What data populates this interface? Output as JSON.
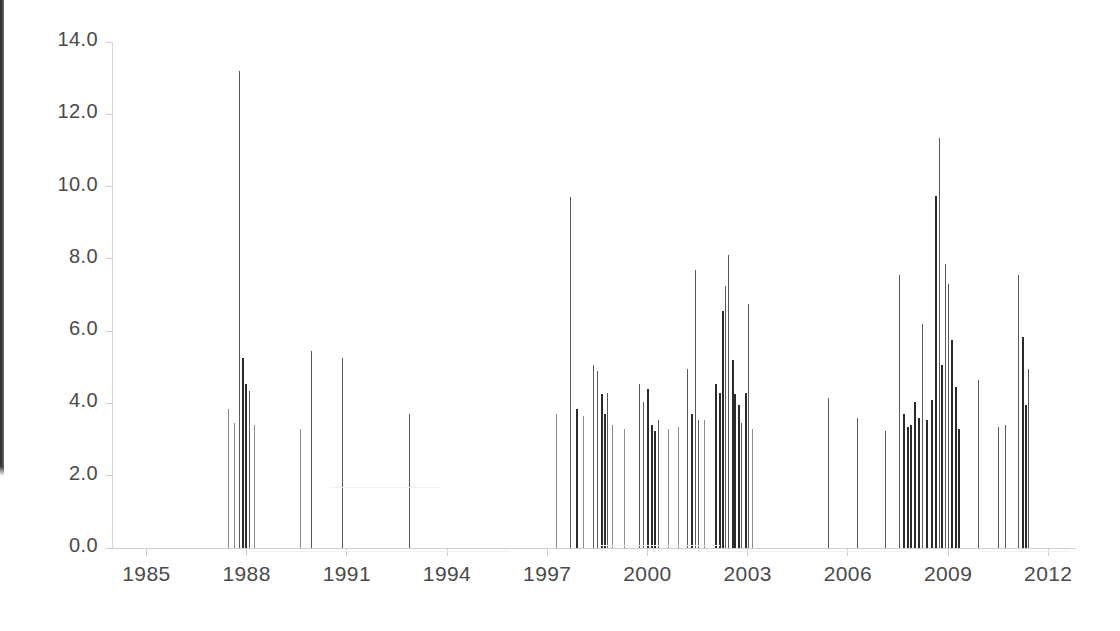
{
  "chart_data": {
    "type": "bar",
    "title": "",
    "subtitle": "",
    "xlabel": "",
    "ylabel": "",
    "xlim": [
      1984.0,
      2012.8
    ],
    "ylim": [
      0.0,
      14.0
    ],
    "grid": false,
    "legend": null,
    "y_ticks": [
      "0.0",
      "2.0",
      "4.0",
      "6.0",
      "8.0",
      "10.0",
      "12.0",
      "14.0"
    ],
    "y_tick_values": [
      0.0,
      2.0,
      4.0,
      6.0,
      8.0,
      10.0,
      12.0,
      14.0
    ],
    "x_ticks": [
      "1985",
      "1988",
      "1991",
      "1994",
      "1997",
      "2000",
      "2003",
      "2006",
      "2009",
      "2012"
    ],
    "x_tick_values": [
      1985,
      1988,
      1991,
      1994,
      1997,
      2000,
      2003,
      2006,
      2009,
      2012
    ],
    "series_name": "magnitude",
    "points": [
      {
        "x": 1987.45,
        "y": 3.85,
        "w": "light"
      },
      {
        "x": 1987.62,
        "y": 3.45,
        "w": "light"
      },
      {
        "x": 1987.78,
        "y": 13.2,
        "w": "normal"
      },
      {
        "x": 1987.86,
        "y": 5.25,
        "w": "heavy"
      },
      {
        "x": 1987.96,
        "y": 4.55,
        "w": "heavy"
      },
      {
        "x": 1988.06,
        "y": 4.35,
        "w": "normal"
      },
      {
        "x": 1988.22,
        "y": 3.4,
        "w": "light"
      },
      {
        "x": 1989.6,
        "y": 3.3,
        "w": "light"
      },
      {
        "x": 1989.92,
        "y": 5.45,
        "w": "normal"
      },
      {
        "x": 1990.86,
        "y": 5.25,
        "w": "normal"
      },
      {
        "x": 1992.85,
        "y": 3.7,
        "w": "normal"
      },
      {
        "x": 1997.25,
        "y": 3.7,
        "w": "light"
      },
      {
        "x": 1997.68,
        "y": 9.7,
        "w": "normal"
      },
      {
        "x": 1997.86,
        "y": 3.85,
        "w": "heavy"
      },
      {
        "x": 1998.06,
        "y": 3.65,
        "w": "light"
      },
      {
        "x": 1998.38,
        "y": 5.05,
        "w": "normal"
      },
      {
        "x": 1998.5,
        "y": 4.9,
        "w": "normal"
      },
      {
        "x": 1998.62,
        "y": 4.25,
        "w": "heavy"
      },
      {
        "x": 1998.7,
        "y": 3.7,
        "w": "heavy"
      },
      {
        "x": 1998.78,
        "y": 4.3,
        "w": "normal"
      },
      {
        "x": 1998.94,
        "y": 3.4,
        "w": "light"
      },
      {
        "x": 1999.3,
        "y": 3.3,
        "w": "light"
      },
      {
        "x": 1999.75,
        "y": 4.55,
        "w": "normal"
      },
      {
        "x": 1999.88,
        "y": 4.05,
        "w": "normal"
      },
      {
        "x": 2000.0,
        "y": 4.4,
        "w": "heavy"
      },
      {
        "x": 2000.1,
        "y": 3.4,
        "w": "heavy"
      },
      {
        "x": 2000.2,
        "y": 3.25,
        "w": "heavy"
      },
      {
        "x": 2000.32,
        "y": 3.55,
        "w": "normal"
      },
      {
        "x": 2000.62,
        "y": 3.3,
        "w": "light"
      },
      {
        "x": 2000.92,
        "y": 3.35,
        "w": "light"
      },
      {
        "x": 2001.18,
        "y": 4.95,
        "w": "normal"
      },
      {
        "x": 2001.3,
        "y": 3.7,
        "w": "heavy"
      },
      {
        "x": 2001.42,
        "y": 7.7,
        "w": "normal"
      },
      {
        "x": 2001.52,
        "y": 3.55,
        "w": "normal"
      },
      {
        "x": 2001.7,
        "y": 3.55,
        "w": "light"
      },
      {
        "x": 2002.02,
        "y": 4.55,
        "w": "heavy"
      },
      {
        "x": 2002.14,
        "y": 4.3,
        "w": "heavy"
      },
      {
        "x": 2002.24,
        "y": 6.55,
        "w": "heavy"
      },
      {
        "x": 2002.32,
        "y": 7.25,
        "w": "normal"
      },
      {
        "x": 2002.42,
        "y": 8.1,
        "w": "normal"
      },
      {
        "x": 2002.52,
        "y": 5.2,
        "w": "heavy"
      },
      {
        "x": 2002.6,
        "y": 4.25,
        "w": "heavy"
      },
      {
        "x": 2002.7,
        "y": 3.95,
        "w": "heavy"
      },
      {
        "x": 2002.8,
        "y": 3.45,
        "w": "normal"
      },
      {
        "x": 2002.92,
        "y": 4.3,
        "w": "heavy"
      },
      {
        "x": 2003.02,
        "y": 6.75,
        "w": "normal"
      },
      {
        "x": 2003.14,
        "y": 3.3,
        "w": "light"
      },
      {
        "x": 2005.4,
        "y": 4.15,
        "w": "normal"
      },
      {
        "x": 2006.28,
        "y": 3.6,
        "w": "normal"
      },
      {
        "x": 2007.12,
        "y": 3.25,
        "w": "normal"
      },
      {
        "x": 2007.52,
        "y": 7.55,
        "w": "normal"
      },
      {
        "x": 2007.64,
        "y": 3.7,
        "w": "heavy"
      },
      {
        "x": 2007.76,
        "y": 3.35,
        "w": "heavy"
      },
      {
        "x": 2007.86,
        "y": 3.4,
        "w": "heavy"
      },
      {
        "x": 2007.98,
        "y": 4.05,
        "w": "heavy"
      },
      {
        "x": 2008.1,
        "y": 3.6,
        "w": "heavy"
      },
      {
        "x": 2008.22,
        "y": 6.2,
        "w": "normal"
      },
      {
        "x": 2008.34,
        "y": 3.55,
        "w": "heavy"
      },
      {
        "x": 2008.48,
        "y": 4.1,
        "w": "heavy"
      },
      {
        "x": 2008.6,
        "y": 9.75,
        "w": "heavy"
      },
      {
        "x": 2008.72,
        "y": 11.35,
        "w": "normal"
      },
      {
        "x": 2008.8,
        "y": 5.05,
        "w": "heavy"
      },
      {
        "x": 2008.9,
        "y": 7.85,
        "w": "normal"
      },
      {
        "x": 2009.0,
        "y": 7.3,
        "w": "normal"
      },
      {
        "x": 2009.1,
        "y": 5.75,
        "w": "heavy"
      },
      {
        "x": 2009.2,
        "y": 4.45,
        "w": "heavy"
      },
      {
        "x": 2009.3,
        "y": 3.3,
        "w": "heavy"
      },
      {
        "x": 2009.9,
        "y": 4.65,
        "w": "normal"
      },
      {
        "x": 2010.48,
        "y": 3.35,
        "w": "normal"
      },
      {
        "x": 2010.7,
        "y": 3.4,
        "w": "normal"
      },
      {
        "x": 2011.1,
        "y": 7.55,
        "w": "normal"
      },
      {
        "x": 2011.2,
        "y": 5.85,
        "w": "heavy"
      },
      {
        "x": 2011.3,
        "y": 3.95,
        "w": "heavy"
      },
      {
        "x": 2011.38,
        "y": 4.95,
        "w": "normal"
      }
    ]
  }
}
